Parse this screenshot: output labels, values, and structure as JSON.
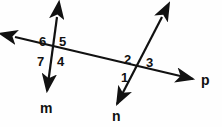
{
  "figure": {
    "background_color": "#fefefe",
    "stroke_color": "#111111",
    "width": 222,
    "height": 127,
    "line_labels": [
      {
        "id": "m",
        "text": "m",
        "x": 40,
        "y": 101
      },
      {
        "id": "n",
        "text": "n",
        "x": 112,
        "y": 109
      },
      {
        "id": "p",
        "text": "p",
        "x": 201,
        "y": 73
      }
    ],
    "angle_labels": [
      {
        "id": "angle-1",
        "text": "1",
        "x": 121,
        "y": 71
      },
      {
        "id": "angle-2",
        "text": "2",
        "x": 124,
        "y": 53
      },
      {
        "id": "angle-3",
        "text": "3",
        "x": 146,
        "y": 56
      },
      {
        "id": "angle-4",
        "text": "4",
        "x": 57,
        "y": 55
      },
      {
        "id": "angle-5",
        "text": "5",
        "x": 59,
        "y": 35
      },
      {
        "id": "angle-6",
        "text": "6",
        "x": 39,
        "y": 35
      },
      {
        "id": "angle-7",
        "text": "7",
        "x": 37,
        "y": 55
      }
    ],
    "lines": [
      {
        "id": "line-m",
        "name": "line-m",
        "x1": 57,
        "y1": 17,
        "x2": 47,
        "y2": 91,
        "arrow_start": true,
        "arrow_end": true
      },
      {
        "id": "line-n",
        "name": "line-n",
        "x1": 162,
        "y1": 17,
        "x2": 117,
        "y2": 104,
        "arrow_start": true,
        "arrow_end": true
      },
      {
        "id": "line-p",
        "name": "line-p-transversal",
        "x1": 15,
        "y1": 37,
        "x2": 193,
        "y2": 79,
        "arrow_start": true,
        "arrow_end": true
      }
    ],
    "intersections": [
      {
        "id": "intersection-m-p",
        "x": 53,
        "y": 46
      },
      {
        "id": "intersection-n-p",
        "x": 139,
        "y": 67
      }
    ]
  }
}
